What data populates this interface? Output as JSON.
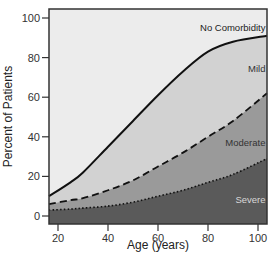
{
  "chart_data": {
    "type": "area",
    "title": "",
    "xlabel": "Age (years)",
    "ylabel": "Percent of Patients",
    "xlim": [
      16.4,
      103.6
    ],
    "ylim": [
      -4,
      104
    ],
    "x_ticks": [
      20,
      40,
      60,
      80,
      100
    ],
    "y_ticks": [
      0,
      20,
      40,
      60,
      80,
      100
    ],
    "grid": false,
    "legend": "inline region labels",
    "x": [
      17,
      25,
      30,
      40,
      50,
      60,
      70,
      80,
      90,
      104
    ],
    "series": [
      {
        "name": "Severe",
        "line_style": "dotted",
        "fill": "#5a5a5a",
        "label_color": "#d8d8d8",
        "values": [
          3,
          3.5,
          4,
          5,
          7,
          10,
          13,
          17,
          21,
          29
        ]
      },
      {
        "name": "Moderate",
        "line_style": "dashed",
        "fill": "#9a9a9a",
        "label_color": "#333333",
        "values": [
          6,
          8,
          9,
          13,
          18,
          25,
          32,
          40,
          48,
          62
        ]
      },
      {
        "name": "Mild",
        "line_style": "solid",
        "fill": "#d2d2d2",
        "label_color": "#333333",
        "values": [
          10,
          17,
          22,
          35,
          48,
          61,
          73,
          83,
          88,
          91
        ]
      },
      {
        "name": "No Comorbidity",
        "line_style": "none",
        "fill": "#ececec",
        "label_color": "#222222",
        "values": [
          100,
          100,
          100,
          100,
          100,
          100,
          100,
          100,
          100,
          100
        ]
      }
    ],
    "annotations": [
      {
        "text": "No Comorbidity",
        "x": 91,
        "y": 95
      },
      {
        "text": "Mild",
        "x": 98,
        "y": 74
      },
      {
        "text": "Moderate",
        "x": 93,
        "y": 37
      },
      {
        "text": "Severe",
        "x": 96,
        "y": 8
      }
    ]
  }
}
